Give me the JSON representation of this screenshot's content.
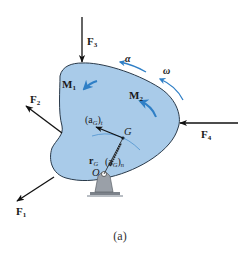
{
  "figure": {
    "caption": "(a)",
    "colors": {
      "body_fill": "#a9cbe9",
      "body_stroke": "#2a3a4a",
      "motion_arrows": "#2f7fc6",
      "force_arrows": "#111111",
      "support_fill": "#9aa0a8"
    },
    "forces": [
      {
        "id": "F1",
        "label": "F",
        "sub": "1"
      },
      {
        "id": "F2",
        "label": "F",
        "sub": "2"
      },
      {
        "id": "F3",
        "label": "F",
        "sub": "3"
      },
      {
        "id": "F4",
        "label": "F",
        "sub": "4"
      }
    ],
    "moments": [
      {
        "id": "M1",
        "label": "M",
        "sub": "1"
      },
      {
        "id": "M2",
        "label": "M",
        "sub": "2"
      }
    ],
    "kinematics": {
      "alpha": "α",
      "omega": "ω",
      "at_label": "(a",
      "at_sub": "G",
      "at_close": ")",
      "at_tsub": "t",
      "an_label": "(a",
      "an_sub": "G",
      "an_close": ")",
      "an_nsub": "n",
      "rG_label": "r",
      "rG_sub": "G",
      "G_point": "G",
      "O_point": "O"
    }
  }
}
